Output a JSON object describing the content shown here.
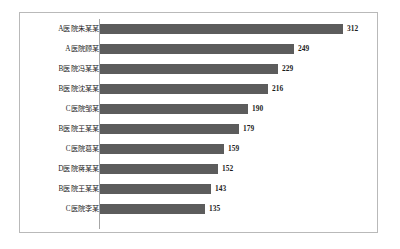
{
  "chart_data": {
    "type": "bar",
    "orientation": "horizontal",
    "title": "",
    "subtitle": "",
    "xlabel": "",
    "ylabel": "",
    "grid": false,
    "legend": false,
    "legend_position": "none",
    "axis_line_color": "#a6a6a6",
    "bar_color": "#5c5c5c",
    "value_label_color": "#1d1d1d",
    "category_label_color": "#232323",
    "frame_border_color": "#b9b9b9",
    "background_color": "#ffffff",
    "xlim": [
      0,
      312
    ],
    "value_labels_shown": true,
    "categories": [
      "A医院朱某某",
      "A医院顾某",
      "B医院冯某某",
      "B医院沈某某",
      "C医院邹某",
      "B医院王某某",
      "C医院葛某",
      "D医院蒋某某",
      "B医院王某某",
      "C医院李某"
    ],
    "values": [
      312,
      249,
      229,
      216,
      190,
      179,
      159,
      152,
      143,
      135
    ],
    "bars": [
      {
        "category": "A医院朱某某",
        "value": 312,
        "label": "312"
      },
      {
        "category": "A医院顾某",
        "value": 249,
        "label": "249"
      },
      {
        "category": "B医院冯某某",
        "value": 229,
        "label": "229"
      },
      {
        "category": "B医院沈某某",
        "value": 216,
        "label": "216"
      },
      {
        "category": "C医院邹某",
        "value": 190,
        "label": "190"
      },
      {
        "category": "B医院王某某",
        "value": 179,
        "label": "179"
      },
      {
        "category": "C医院葛某",
        "value": 159,
        "label": "159"
      },
      {
        "category": "D医院蒋某某",
        "value": 152,
        "label": "152"
      },
      {
        "category": "B医院王某某",
        "value": 143,
        "label": "143"
      },
      {
        "category": "C医院李某",
        "value": 135,
        "label": "135"
      }
    ]
  }
}
